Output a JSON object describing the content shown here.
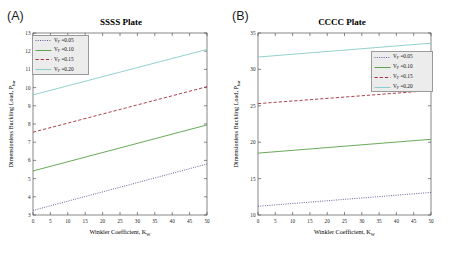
{
  "figure": {
    "xlabel_main": "Winkler Coefficient, K",
    "xlabel_sub": "W",
    "ylabel_main": "Dimensionless Buckling Load, P",
    "ylabel_sub": "bar",
    "colors": {
      "vf005": "#4a4a8c",
      "vf010": "#4d9a3a",
      "vf015": "#9c1f2e",
      "vf020": "#7fc9c6",
      "legend_bg": "#ececec",
      "legend_border": "#9a9a9a",
      "axis": "#555555"
    }
  },
  "panels": [
    {
      "tag": "(A)",
      "title": "SSSS Plate",
      "legend_position": "top-left",
      "legend": [
        {
          "label_main": "V",
          "label_sub": "F",
          "label_val": " =0.05",
          "style": "dashdot",
          "color": "#4a4a8c"
        },
        {
          "label_main": "V",
          "label_sub": "F",
          "label_val": " =0.10",
          "style": "solid",
          "color": "#4d9a3a"
        },
        {
          "label_main": "V",
          "label_sub": "F",
          "label_val": " =0.15",
          "style": "dashed",
          "color": "#9c1f2e"
        },
        {
          "label_main": "V",
          "label_sub": "F",
          "label_val": " =0.20",
          "style": "solid",
          "color": "#7fc9c6"
        }
      ]
    },
    {
      "tag": "(B)",
      "title": "CCCC Plate",
      "legend_position": "upper-right",
      "legend": [
        {
          "label_main": "V",
          "label_sub": "F",
          "label_val": " =0.05",
          "style": "dashdot",
          "color": "#4a4a8c"
        },
        {
          "label_main": "V",
          "label_sub": "F",
          "label_val": " =0.10",
          "style": "solid",
          "color": "#4d9a3a"
        },
        {
          "label_main": "V",
          "label_sub": "F",
          "label_val": " =0.15",
          "style": "dashed",
          "color": "#9c1f2e"
        },
        {
          "label_main": "V",
          "label_sub": "F",
          "label_val": " =0.20",
          "style": "solid",
          "color": "#7fc9c6"
        }
      ]
    }
  ],
  "chart_data": [
    {
      "type": "line",
      "panel": "(A)",
      "title": "SSSS Plate",
      "xlabel": "Winkler Coefficient, K_W",
      "ylabel": "Dimensionless Buckling Load, P_bar",
      "xlim": [
        0,
        50
      ],
      "ylim": [
        3,
        13
      ],
      "xticks": [
        0,
        5,
        10,
        15,
        20,
        25,
        30,
        35,
        40,
        45,
        50
      ],
      "yticks": [
        3,
        4,
        5,
        6,
        7,
        8,
        9,
        10,
        11,
        12,
        13
      ],
      "grid": false,
      "legend_position": "upper left",
      "x": [
        0,
        50
      ],
      "series": [
        {
          "name": "V_F =0.05",
          "values": [
            3.25,
            5.8
          ],
          "style": "dashdot",
          "color": "#4a4a8c"
        },
        {
          "name": "V_F =0.10",
          "values": [
            5.42,
            7.95
          ],
          "style": "solid",
          "color": "#4d9a3a"
        },
        {
          "name": "V_F =0.15",
          "values": [
            7.55,
            10.05
          ],
          "style": "dashed",
          "color": "#9c1f2e"
        },
        {
          "name": "V_F =0.20",
          "values": [
            9.6,
            12.1
          ],
          "style": "solid",
          "color": "#7fc9c6"
        }
      ]
    },
    {
      "type": "line",
      "panel": "(B)",
      "title": "CCCC Plate",
      "xlabel": "Winkler Coefficient, K_W",
      "ylabel": "Dimensionless Buckling Load, P_bar",
      "xlim": [
        0,
        50
      ],
      "ylim": [
        10,
        35
      ],
      "xticks": [
        0,
        5,
        10,
        15,
        20,
        25,
        30,
        35,
        40,
        45,
        50
      ],
      "yticks": [
        10,
        15,
        20,
        25,
        30,
        35
      ],
      "grid": false,
      "legend_position": "upper right",
      "x": [
        0,
        50
      ],
      "series": [
        {
          "name": "V_F =0.05",
          "values": [
            11.2,
            13.1
          ],
          "style": "dashdot",
          "color": "#4a4a8c"
        },
        {
          "name": "V_F =0.10",
          "values": [
            18.5,
            20.4
          ],
          "style": "solid",
          "color": "#4d9a3a"
        },
        {
          "name": "V_F =0.15",
          "values": [
            25.3,
            27.1
          ],
          "style": "dashed",
          "color": "#9c1f2e"
        },
        {
          "name": "V_F =0.20",
          "values": [
            31.7,
            33.6
          ],
          "style": "solid",
          "color": "#7fc9c6"
        }
      ]
    }
  ]
}
